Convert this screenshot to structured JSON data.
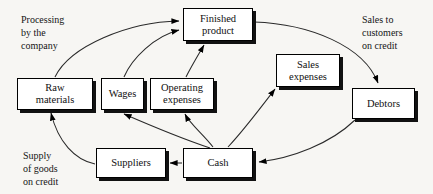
{
  "diagram": {
    "canvas": {
      "width": 433,
      "height": 194,
      "background": "#f7f6f3"
    },
    "style": {
      "box_fill": "#ffffff",
      "box_stroke": "#000000",
      "shadow": "#111111",
      "text": "#101010"
    },
    "nodes": [
      {
        "id": "finished_product",
        "label": "Finished\nproduct",
        "line1": "Finished",
        "line2": "product",
        "x": 183,
        "y": 8,
        "w": 70,
        "h": 33
      },
      {
        "id": "raw_materials",
        "label": "Raw\nmaterials",
        "line1": "Raw",
        "line2": "materials",
        "x": 17,
        "y": 78,
        "w": 76,
        "h": 32
      },
      {
        "id": "wages",
        "label": "Wages",
        "line1": "Wages",
        "line2": "",
        "x": 101,
        "y": 78,
        "w": 43,
        "h": 32
      },
      {
        "id": "operating_expenses",
        "label": "Operating\nexpenses",
        "line1": "Operating",
        "line2": "expenses",
        "x": 150,
        "y": 78,
        "w": 64,
        "h": 32
      },
      {
        "id": "sales_expenses",
        "label": "Sales\nexpenses",
        "line1": "Sales",
        "line2": "expenses",
        "x": 276,
        "y": 54,
        "w": 64,
        "h": 33
      },
      {
        "id": "debtors",
        "label": "Debtors",
        "line1": "Debtors",
        "line2": "",
        "x": 352,
        "y": 88,
        "w": 63,
        "h": 31
      },
      {
        "id": "suppliers",
        "label": "Suppliers",
        "line1": "Suppliers",
        "line2": "",
        "x": 96,
        "y": 148,
        "w": 70,
        "h": 30
      },
      {
        "id": "cash",
        "label": "Cash",
        "line1": "Cash",
        "line2": "",
        "x": 183,
        "y": 148,
        "w": 70,
        "h": 30
      }
    ],
    "annotations": [
      {
        "id": "processing",
        "text": "Processing\nby the\ncompany",
        "x": 21,
        "y": 14
      },
      {
        "id": "sales_to_customers",
        "text": "Sales to\ncustomers\non credit",
        "x": 362,
        "y": 14
      },
      {
        "id": "supply_of_goods",
        "text": "Supply\nof goods\non credit",
        "x": 23,
        "y": 150
      }
    ],
    "edges": [
      {
        "id": "raw-to-finished",
        "from": "raw_materials",
        "to": "finished_product",
        "path": "M 55 77 C 70 46 128 22 179 21"
      },
      {
        "id": "wages-to-finished",
        "from": "wages",
        "to": "finished_product",
        "path": "M 124 77 C 132 58 155 36 179 30"
      },
      {
        "id": "operating-to-finished",
        "from": "operating_expenses",
        "to": "finished_product",
        "path": "M 186 77 C 192 65 200 52 204 45"
      },
      {
        "id": "finished-to-debtors",
        "from": "finished_product",
        "to": "debtors",
        "path": "M 254 22 C 310 24 364 46 378 83"
      },
      {
        "id": "debtors-to-cash",
        "from": "debtors",
        "to": "cash",
        "path": "M 355 120 C 330 144 292 158 259 162"
      },
      {
        "id": "cash-to-sales-expenses",
        "from": "cash",
        "to": "sales_expenses",
        "path": "M 228 147 C 244 130 262 106 275 89"
      },
      {
        "id": "cash-to-operating",
        "from": "cash",
        "to": "operating_expenses",
        "path": "M 213 147 C 203 134 190 124 185 114"
      },
      {
        "id": "cash-to-wages",
        "from": "cash",
        "to": "wages",
        "path": "M 210 148 C 180 138 147 124 124 114"
      },
      {
        "id": "cash-to-suppliers",
        "from": "cash",
        "to": "suppliers",
        "path": "M 182 163 L 170 163"
      },
      {
        "id": "suppliers-to-raw",
        "from": "suppliers",
        "to": "raw_materials",
        "path": "M 95 164 C 75 160 58 142 51 113"
      }
    ]
  }
}
